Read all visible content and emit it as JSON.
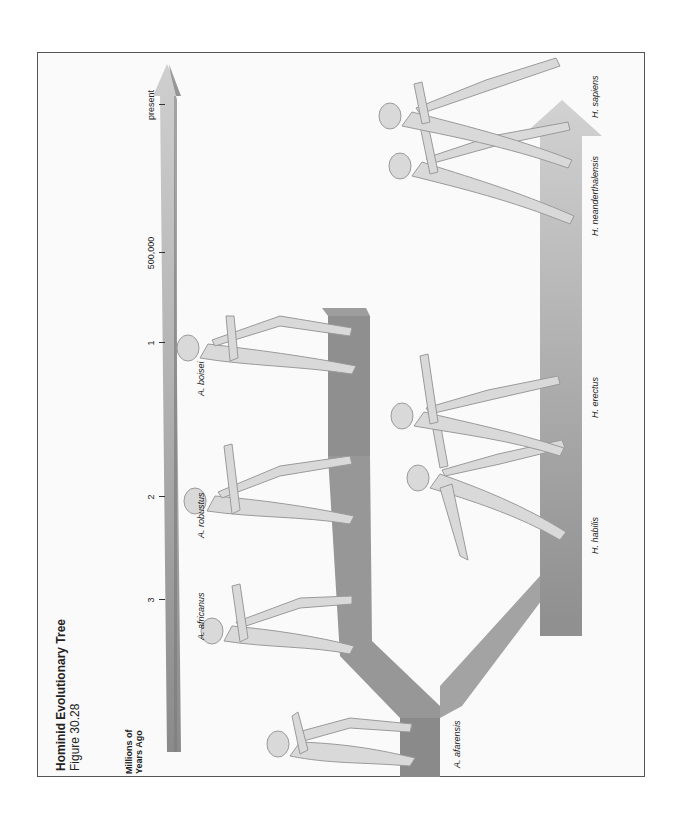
{
  "figure": {
    "title": "Hominid Evolutionary Tree",
    "subtitle": "Figure 30.28",
    "axis_label_line1": "Millions of",
    "axis_label_line2": "Years Ago"
  },
  "timeline": {
    "ticks": [
      {
        "label": "3"
      },
      {
        "label": "2"
      },
      {
        "label": "1"
      },
      {
        "label": "500,000"
      },
      {
        "label": "present"
      }
    ]
  },
  "species": [
    {
      "label": "A. afarensis"
    },
    {
      "label": "A. africanus"
    },
    {
      "label": "A. robustus"
    },
    {
      "label": "A. boisei"
    },
    {
      "label": "H. habilis"
    },
    {
      "label": "H. erectus"
    },
    {
      "label": "H. neanderthalensis"
    },
    {
      "label": "H. sapiens"
    }
  ],
  "colors": {
    "branch_dark": "#8f8f8f",
    "branch_light": "#c8c8c8",
    "timeline_bar": "#a9a9a9",
    "figure_skin": "#d8d8d8",
    "frame_border": "#555555"
  }
}
